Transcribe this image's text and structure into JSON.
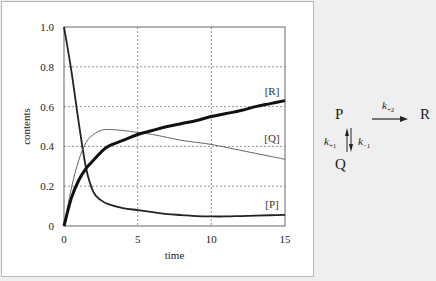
{
  "chart_data": {
    "type": "line",
    "title": "",
    "xlabel": "time",
    "ylabel": "contents",
    "xlim": [
      0,
      15
    ],
    "ylim": [
      0,
      1.0
    ],
    "x_ticks": [
      "0",
      "5",
      "10",
      "15"
    ],
    "y_ticks": [
      "0",
      "0.2",
      "0.4",
      "0.6",
      "0.8",
      "1.0"
    ],
    "grid": true,
    "legend": "inline labels",
    "x": [
      0,
      0.5,
      1,
      1.5,
      2,
      2.5,
      3,
      4,
      5,
      6,
      7,
      8,
      9,
      10,
      11,
      12,
      13,
      14,
      15
    ],
    "series": [
      {
        "name": "[P]",
        "label": "[P]",
        "style": "medium",
        "values": [
          1.0,
          0.78,
          0.52,
          0.29,
          0.17,
          0.13,
          0.11,
          0.09,
          0.08,
          0.07,
          0.06,
          0.055,
          0.05,
          0.048,
          0.048,
          0.05,
          0.052,
          0.054,
          0.056
        ]
      },
      {
        "name": "[Q]",
        "label": "[Q]",
        "style": "thin",
        "values": [
          0.0,
          0.19,
          0.33,
          0.42,
          0.46,
          0.48,
          0.485,
          0.48,
          0.47,
          0.46,
          0.445,
          0.43,
          0.42,
          0.41,
          0.395,
          0.38,
          0.365,
          0.35,
          0.335
        ]
      },
      {
        "name": "[R]",
        "label": "[R]",
        "style": "thick",
        "values": [
          0.0,
          0.14,
          0.23,
          0.29,
          0.33,
          0.37,
          0.4,
          0.43,
          0.46,
          0.48,
          0.5,
          0.515,
          0.53,
          0.55,
          0.565,
          0.58,
          0.6,
          0.615,
          0.63
        ]
      }
    ]
  },
  "scheme": {
    "species": [
      "P",
      "Q",
      "R"
    ],
    "k_forward_to_R": "k",
    "k_forward_to_R_sub": "+2",
    "k_plus1": "k",
    "k_plus1_sub": "+1",
    "k_minus1": "k",
    "k_minus1_sub": "−1"
  }
}
